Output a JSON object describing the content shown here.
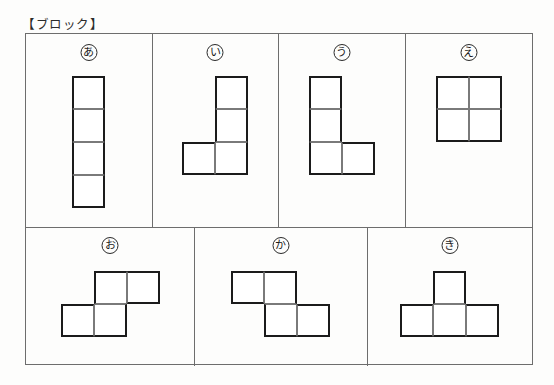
{
  "page": {
    "title": "【ブロック】",
    "background_color": "#fdfdfc",
    "frame_color": "#6d6d6d",
    "shape_outline_color": "#1b1b1b",
    "shape_inner_color": "#7a7a7a"
  },
  "rows": [
    {
      "name": "top-row",
      "panels": [
        {
          "id": "a",
          "label": "あ",
          "shape_name": "I-tetromino",
          "cols": 1,
          "rows": 4,
          "grid": [
            [
              1
            ],
            [
              1
            ],
            [
              1
            ],
            [
              1
            ]
          ]
        },
        {
          "id": "i",
          "label": "い",
          "shape_name": "J-tetromino",
          "cols": 2,
          "rows": 3,
          "grid": [
            [
              0,
              1
            ],
            [
              0,
              1
            ],
            [
              1,
              1
            ]
          ]
        },
        {
          "id": "u",
          "label": "う",
          "shape_name": "L-tetromino",
          "cols": 2,
          "rows": 3,
          "grid": [
            [
              1,
              0
            ],
            [
              1,
              0
            ],
            [
              1,
              1
            ]
          ]
        },
        {
          "id": "e",
          "label": "え",
          "shape_name": "O-tetromino",
          "cols": 2,
          "rows": 2,
          "grid": [
            [
              1,
              1
            ],
            [
              1,
              1
            ]
          ]
        }
      ]
    },
    {
      "name": "bottom-row",
      "panels": [
        {
          "id": "o",
          "label": "お",
          "shape_name": "S-tetromino",
          "cols": 3,
          "rows": 2,
          "grid": [
            [
              0,
              1,
              1
            ],
            [
              1,
              1,
              0
            ]
          ]
        },
        {
          "id": "ka",
          "label": "か",
          "shape_name": "Z-tetromino",
          "cols": 3,
          "rows": 2,
          "grid": [
            [
              1,
              1,
              0
            ],
            [
              0,
              1,
              1
            ]
          ]
        },
        {
          "id": "ki",
          "label": "き",
          "shape_name": "T-tetromino",
          "cols": 3,
          "rows": 2,
          "grid": [
            [
              0,
              1,
              0
            ],
            [
              1,
              1,
              1
            ]
          ]
        }
      ]
    }
  ]
}
